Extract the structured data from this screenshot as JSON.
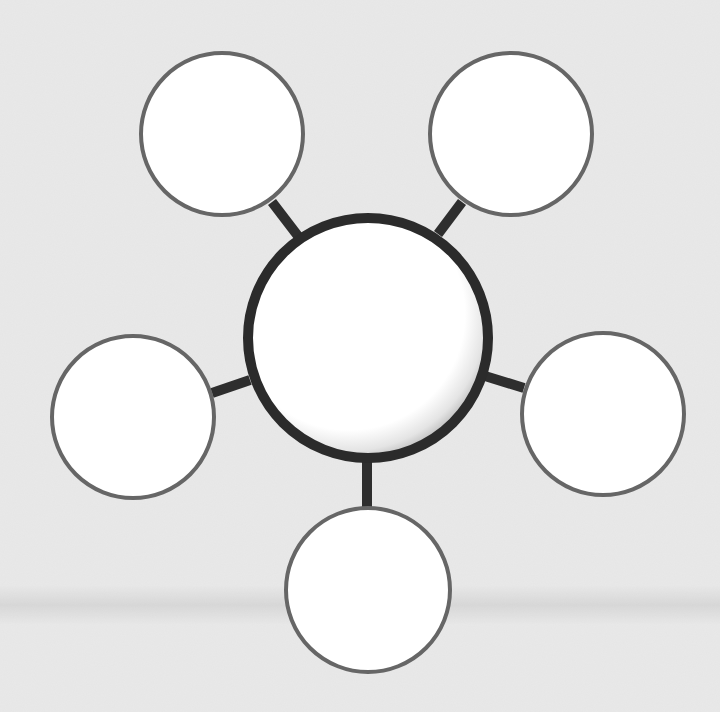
{
  "diagram": {
    "type": "bubble-map",
    "background": "#e9e9e9",
    "bottom_strip_color": "#ffffff",
    "connector_color": "#2e2e2e",
    "center_node": {
      "label": "",
      "cx": 368,
      "cy": 338,
      "r": 120,
      "stroke": "#2b2b2b",
      "stroke_width": 10,
      "fill": "#ffffff"
    },
    "outer_nodes": [
      {
        "id": "top-left",
        "label": "",
        "cx": 222,
        "cy": 134,
        "r": 81
      },
      {
        "id": "top-right",
        "label": "",
        "cx": 511,
        "cy": 134,
        "r": 81
      },
      {
        "id": "left",
        "label": "",
        "cx": 133,
        "cy": 417,
        "r": 81
      },
      {
        "id": "right",
        "label": "",
        "cx": 603,
        "cy": 414,
        "r": 81
      },
      {
        "id": "bottom",
        "label": "",
        "cx": 368,
        "cy": 590,
        "r": 82
      }
    ],
    "outer_node_style": {
      "stroke": "#666666",
      "stroke_width": 4,
      "fill": "#ffffff"
    }
  }
}
